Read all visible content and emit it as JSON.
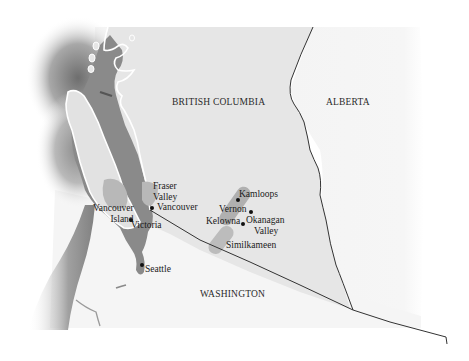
{
  "map": {
    "regions": [
      {
        "id": "british-columbia",
        "label": "BRITISH COLUMBIA"
      },
      {
        "id": "alberta",
        "label": "ALBERTA"
      },
      {
        "id": "washington",
        "label": "WASHINGTON"
      }
    ],
    "wine_regions": [
      {
        "id": "fraser-valley",
        "label_line1": "Fraser",
        "label_line2": "Valley"
      },
      {
        "id": "vancouver-island",
        "label_line1": "Vancouver",
        "label_line2": "Island"
      },
      {
        "id": "okanagan-valley",
        "label_line1": "Okanagan",
        "label_line2": "Valley"
      },
      {
        "id": "similkameen",
        "label": "Similkameen"
      }
    ],
    "cities": [
      {
        "id": "vancouver",
        "label": "Vancouver"
      },
      {
        "id": "victoria",
        "label": "Victoria"
      },
      {
        "id": "seattle",
        "label": "Seattle"
      },
      {
        "id": "kamloops",
        "label": "Kamloops"
      },
      {
        "id": "vernon",
        "label": "Vernon"
      },
      {
        "id": "kelowna",
        "label": "Kelowna"
      }
    ],
    "colors": {
      "land_bc": "#e6e6e6",
      "land_other": "#f4f4f4",
      "water_dark": "#8a8a8a",
      "wine_region": "#b4b4b4",
      "border": "#333333",
      "coast_outline": "#ffffff"
    }
  }
}
